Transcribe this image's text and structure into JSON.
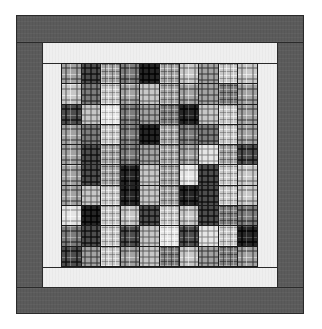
{
  "image": {
    "subject": "Plaid patchwork quilt with borders",
    "colors": {
      "outer_border": "#5b5b5b",
      "inner_border": "#efefef",
      "seam": "#1a1a1a"
    }
  },
  "quilt": {
    "rows": 10,
    "cols": 10,
    "tone_scale": "0 = very light … 5 = very dark",
    "tones": [
      [
        2,
        4,
        2,
        3,
        5,
        2,
        1,
        2,
        1,
        1
      ],
      [
        1,
        3,
        1,
        2,
        1,
        2,
        2,
        2,
        3,
        2
      ],
      [
        4,
        1,
        0,
        3,
        2,
        3,
        5,
        1,
        1,
        2
      ],
      [
        2,
        3,
        1,
        3,
        5,
        2,
        3,
        3,
        1,
        2
      ],
      [
        2,
        4,
        2,
        3,
        2,
        2,
        2,
        0,
        2,
        4
      ],
      [
        2,
        4,
        2,
        5,
        1,
        2,
        0,
        4,
        1,
        1
      ],
      [
        2,
        1,
        1,
        5,
        1,
        2,
        5,
        4,
        1,
        1
      ],
      [
        0,
        5,
        1,
        1,
        4,
        1,
        1,
        4,
        3,
        3
      ],
      [
        3,
        4,
        1,
        4,
        1,
        0,
        4,
        0,
        1,
        5
      ],
      [
        4,
        2,
        1,
        2,
        1,
        3,
        1,
        2,
        3,
        2
      ]
    ]
  }
}
